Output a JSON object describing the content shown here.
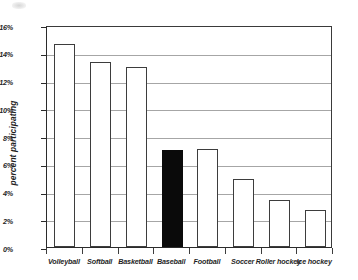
{
  "chart_data": {
    "type": "bar",
    "title": "",
    "subtitle": "",
    "xlabel": "",
    "ylabel": "percent participating",
    "categories": [
      "Volleyball",
      "Softball",
      "Basketball",
      "Baseball",
      "Football",
      "Soccer",
      "Roller hockey",
      "Ice hockey"
    ],
    "values": [
      14.6,
      13.3,
      13.0,
      7.0,
      7.05,
      4.9,
      3.4,
      2.7
    ],
    "ylim": [
      0,
      16
    ],
    "ytick_values": [
      0,
      2,
      4,
      6,
      8,
      10,
      12,
      14,
      16
    ],
    "ytick_labels": [
      "0%",
      "2%",
      "4%",
      "6%",
      "8%",
      "10%",
      "12%",
      "14%",
      "16%"
    ],
    "grid": true,
    "legend": null,
    "highlight_index": 3,
    "bar_fill_default": "#ffffff",
    "bar_fill_highlight": "#0a0a0a",
    "bar_edge_color": "#3d3d3d",
    "gridline_color": "#a6a6a6",
    "axis_color": "#2b2b2b",
    "annotations": []
  }
}
